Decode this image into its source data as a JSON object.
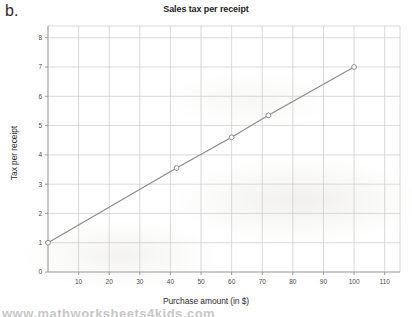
{
  "panel": {
    "label": "b."
  },
  "chart_data": {
    "type": "line",
    "title": "Sales tax per receipt",
    "xlabel": "Purchase amount (in $)",
    "ylabel": "Tax per receipt",
    "xlim": [
      0,
      115
    ],
    "ylim": [
      0,
      8.4
    ],
    "xticks": [
      10,
      20,
      30,
      40,
      50,
      60,
      70,
      80,
      90,
      100,
      110
    ],
    "yticks": [
      0,
      1,
      2,
      3,
      4,
      5,
      6,
      7,
      8
    ],
    "xtick_labels": [
      "10",
      "20",
      "30",
      "40",
      "50",
      "60",
      "70",
      "80",
      "90",
      "100",
      "110"
    ],
    "ytick_labels": [
      "0",
      "1",
      "2",
      "3",
      "4",
      "5",
      "6",
      "7",
      "8"
    ],
    "grid": true,
    "legend": null,
    "marker": "open-circle",
    "line_color": "#8c8c8c",
    "marker_color": "#8c8c8c",
    "grid_color": "#c8c8c8",
    "axis_color": "#9a9a9a",
    "x": [
      0,
      42,
      60,
      72,
      100
    ],
    "y": [
      1.0,
      3.55,
      4.6,
      5.35,
      7.0
    ],
    "points": [
      {
        "x": 0,
        "y": 1.0
      },
      {
        "x": 42,
        "y": 3.55
      },
      {
        "x": 60,
        "y": 4.6
      },
      {
        "x": 72,
        "y": 5.35
      },
      {
        "x": 100,
        "y": 7.0
      }
    ]
  },
  "watermark": {
    "text": "www.mathworksheets4kids.com"
  }
}
